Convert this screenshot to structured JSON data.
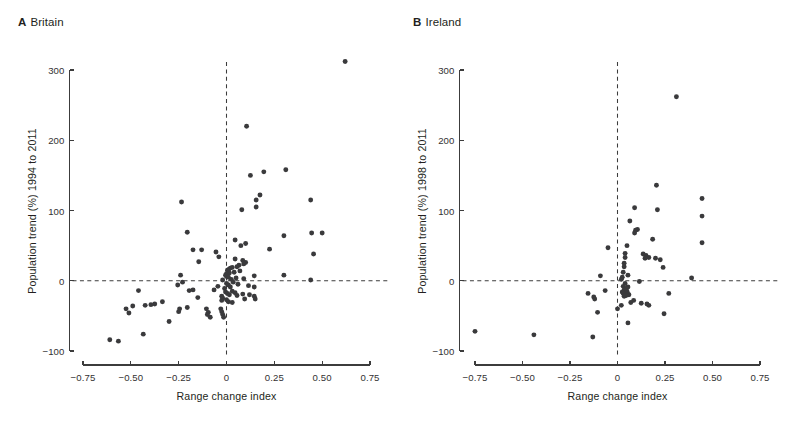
{
  "figure": {
    "background": "#ffffff",
    "dot_color": "#3a3a3c",
    "axis_color": "#3c3c3c",
    "width": 795,
    "height": 432
  },
  "panels": [
    {
      "id": "A",
      "tag": "A",
      "title": "Britain",
      "chart_index": 0
    },
    {
      "id": "B",
      "tag": "B",
      "title": "Ireland",
      "chart_index": 1
    }
  ],
  "chart_data": [
    {
      "type": "scatter",
      "panel": "A",
      "panel_tag": "A",
      "title": "Britain",
      "xlabel": "Range change index",
      "ylabel": "Population trend (%) 1994 to 2011",
      "xlim": [
        -0.75,
        0.75
      ],
      "ylim": [
        -100,
        300
      ],
      "xticks": [
        -0.75,
        -0.5,
        -0.25,
        0,
        0.25,
        0.5,
        0.75
      ],
      "xticklabels": [
        "−0.75",
        "−0.50",
        "−0.25",
        "0",
        "0.25",
        "0.50",
        "0.75"
      ],
      "yticks": [
        -100,
        0,
        100,
        200,
        300
      ],
      "yticklabels": [
        "−100",
        "0",
        "100",
        "200",
        "300"
      ],
      "grid": false,
      "legend": null,
      "reference_lines": [
        {
          "axis": "y",
          "value": 0,
          "style": "dashed"
        },
        {
          "axis": "x",
          "value": 0,
          "style": "dashed"
        }
      ],
      "n_points": 104,
      "points": [
        [
          0.62,
          312
        ],
        [
          0.105,
          220
        ],
        [
          0.31,
          158
        ],
        [
          0.195,
          155
        ],
        [
          0.125,
          150
        ],
        [
          0.175,
          122
        ],
        [
          0.44,
          115
        ],
        [
          0.155,
          115
        ],
        [
          -0.235,
          112
        ],
        [
          0.155,
          105
        ],
        [
          0.08,
          101
        ],
        [
          -0.205,
          69
        ],
        [
          0.5,
          68
        ],
        [
          0.445,
          68
        ],
        [
          0.3,
          64
        ],
        [
          0.045,
          58
        ],
        [
          0.1,
          53
        ],
        [
          0.075,
          50
        ],
        [
          0.225,
          45
        ],
        [
          -0.175,
          44
        ],
        [
          0.455,
          38
        ],
        [
          -0.13,
          44
        ],
        [
          -0.055,
          41
        ],
        [
          -0.04,
          34
        ],
        [
          -0.145,
          27
        ],
        [
          0.045,
          31
        ],
        [
          0.085,
          29
        ],
        [
          0.1,
          26
        ],
        [
          0.09,
          24
        ],
        [
          0.065,
          22
        ],
        [
          0.055,
          20
        ],
        [
          0.03,
          19
        ],
        [
          0.02,
          18
        ],
        [
          0.012,
          16
        ],
        [
          0.005,
          15
        ],
        [
          0.07,
          14
        ],
        [
          0.04,
          12
        ],
        [
          0.015,
          11
        ],
        [
          0.0,
          10
        ],
        [
          -0.005,
          8
        ],
        [
          0.3,
          8
        ],
        [
          0.145,
          7
        ],
        [
          -0.24,
          8
        ],
        [
          0.0,
          6
        ],
        [
          0.01,
          5
        ],
        [
          0.05,
          4
        ],
        [
          0.09,
          3
        ],
        [
          0.025,
          2
        ],
        [
          0.44,
          1
        ],
        [
          -0.02,
          1
        ],
        [
          -0.23,
          -2
        ],
        [
          -0.255,
          -6
        ],
        [
          0.035,
          -2
        ],
        [
          0.0,
          -4
        ],
        [
          0.01,
          -6
        ],
        [
          0.06,
          -5
        ],
        [
          0.115,
          -7
        ],
        [
          -0.045,
          -8
        ],
        [
          0.02,
          -9
        ],
        [
          -0.01,
          -11
        ],
        [
          0.145,
          -9
        ],
        [
          -0.46,
          -14
        ],
        [
          -0.175,
          -13
        ],
        [
          -0.195,
          -14
        ],
        [
          -0.065,
          -13
        ],
        [
          -0.005,
          -16
        ],
        [
          0.03,
          -15
        ],
        [
          0.045,
          -17
        ],
        [
          0.005,
          -18
        ],
        [
          0.015,
          -20
        ],
        [
          0.055,
          -21
        ],
        [
          0.085,
          -19
        ],
        [
          0.12,
          -20
        ],
        [
          0.145,
          -22
        ],
        [
          0.15,
          -26
        ],
        [
          0.095,
          -26
        ],
        [
          -0.025,
          -22
        ],
        [
          -0.02,
          -25
        ],
        [
          -0.15,
          -24
        ],
        [
          -0.025,
          -28
        ],
        [
          0.0,
          -27
        ],
        [
          0.01,
          -30
        ],
        [
          0.03,
          -31
        ],
        [
          -0.335,
          -30
        ],
        [
          -0.375,
          -33
        ],
        [
          -0.395,
          -34
        ],
        [
          -0.425,
          -35
        ],
        [
          -0.49,
          -36
        ],
        [
          -0.205,
          -38
        ],
        [
          -0.245,
          -40
        ],
        [
          -0.25,
          -44
        ],
        [
          -0.525,
          -40
        ],
        [
          -0.51,
          -46
        ],
        [
          -0.105,
          -40
        ],
        [
          -0.095,
          -45
        ],
        [
          -0.1,
          -48
        ],
        [
          -0.085,
          -52
        ],
        [
          -0.03,
          -40
        ],
        [
          -0.025,
          -44
        ],
        [
          -0.02,
          -48
        ],
        [
          -0.015,
          -52
        ],
        [
          -0.3,
          -58
        ],
        [
          -0.435,
          -76
        ],
        [
          -0.61,
          -84
        ],
        [
          -0.565,
          -86
        ]
      ]
    },
    {
      "type": "scatter",
      "panel": "B",
      "panel_tag": "B",
      "title": "Ireland",
      "xlabel": "Range change index",
      "ylabel": "Population trend (%) 1998 to 2011",
      "xlim": [
        -0.75,
        0.75
      ],
      "ylim": [
        -100,
        300
      ],
      "xticks": [
        -0.75,
        -0.5,
        -0.25,
        0,
        0.25,
        0.5,
        0.75
      ],
      "xticklabels": [
        "−0.75",
        "−0.50",
        "−0.25",
        "0",
        "0.25",
        "0.50",
        "0.75"
      ],
      "yticks": [
        -100,
        0,
        100,
        200,
        300
      ],
      "yticklabels": [
        "−100",
        "0",
        "100",
        "200",
        "300"
      ],
      "grid": false,
      "legend": null,
      "reference_lines": [
        {
          "axis": "y",
          "value": 0,
          "style": "dashed"
        },
        {
          "axis": "x",
          "value": 0,
          "style": "dashed"
        }
      ],
      "n_points": 63,
      "points": [
        [
          0.31,
          262
        ],
        [
          0.205,
          136
        ],
        [
          0.445,
          117
        ],
        [
          0.09,
          104
        ],
        [
          0.21,
          101
        ],
        [
          0.445,
          92
        ],
        [
          0.065,
          85
        ],
        [
          0.105,
          73
        ],
        [
          0.095,
          72
        ],
        [
          0.09,
          68
        ],
        [
          0.185,
          59
        ],
        [
          0.445,
          54
        ],
        [
          0.05,
          50
        ],
        [
          -0.05,
          47
        ],
        [
          0.04,
          39
        ],
        [
          0.135,
          38
        ],
        [
          0.15,
          36
        ],
        [
          0.04,
          33
        ],
        [
          0.165,
          33
        ],
        [
          0.145,
          32
        ],
        [
          0.2,
          32
        ],
        [
          0.225,
          30
        ],
        [
          0.035,
          25
        ],
        [
          0.035,
          20
        ],
        [
          0.24,
          19
        ],
        [
          0.03,
          12
        ],
        [
          0.055,
          8
        ],
        [
          -0.09,
          7
        ],
        [
          0.025,
          5
        ],
        [
          0.02,
          2
        ],
        [
          0.115,
          -1
        ],
        [
          0.39,
          4
        ],
        [
          0.04,
          -4
        ],
        [
          0.03,
          -8
        ],
        [
          0.055,
          -9
        ],
        [
          0.045,
          -11
        ],
        [
          0.035,
          -13
        ],
        [
          -0.065,
          -14
        ],
        [
          0.05,
          -15
        ],
        [
          0.025,
          -16
        ],
        [
          0.04,
          -17
        ],
        [
          0.03,
          -18
        ],
        [
          0.055,
          -19
        ],
        [
          0.06,
          -20
        ],
        [
          0.045,
          -21
        ],
        [
          0.035,
          -22
        ],
        [
          -0.155,
          -18
        ],
        [
          -0.125,
          -23
        ],
        [
          -0.12,
          -26
        ],
        [
          0.27,
          -18
        ],
        [
          0.085,
          -28
        ],
        [
          0.07,
          -31
        ],
        [
          0.125,
          -32
        ],
        [
          0.155,
          -33
        ],
        [
          0.165,
          -35
        ],
        [
          0.02,
          -35
        ],
        [
          -0.105,
          -45
        ],
        [
          0.245,
          -47
        ],
        [
          0.055,
          -60
        ],
        [
          -0.13,
          -80
        ],
        [
          -0.44,
          -77
        ],
        [
          -0.75,
          -72
        ],
        [
          0.0,
          -40
        ]
      ]
    }
  ]
}
